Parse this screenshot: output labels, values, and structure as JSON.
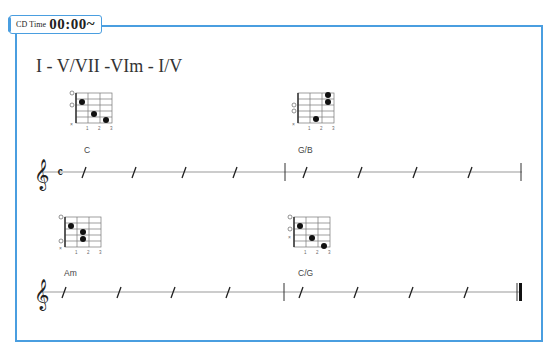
{
  "header": {
    "badge_label": "CD Time",
    "time": "00:00~"
  },
  "progression": {
    "title": "I - V/VII -VIm - I/V"
  },
  "colors": {
    "frame": "#4a9ee0",
    "ink": "#222222",
    "staff_line": "#999999"
  },
  "systems": [
    {
      "clef": "treble-clef",
      "time_signature": "common-time",
      "measures": [
        {
          "chord": "C",
          "beats": 4,
          "notation": "slash"
        },
        {
          "chord": "G/B",
          "beats": 4,
          "notation": "slash"
        }
      ],
      "end_barline": "single"
    },
    {
      "clef": "treble-clef",
      "measures": [
        {
          "chord": "Am",
          "beats": 4,
          "notation": "slash"
        },
        {
          "chord": "C/G",
          "beats": 4,
          "notation": "slash"
        }
      ],
      "end_barline": "final"
    }
  ],
  "chord_diagrams": [
    {
      "name": "C",
      "string_marks": [
        "O",
        "O",
        "",
        "",
        "",
        "x"
      ],
      "dots": [
        {
          "string": 2,
          "fret": 1
        },
        {
          "string": 4,
          "fret": 2
        },
        {
          "string": 5,
          "fret": 3
        }
      ],
      "fret_numbers": [
        "1",
        "2",
        "3"
      ]
    },
    {
      "name": "G/B",
      "string_marks": [
        "",
        "",
        "O",
        "O",
        "",
        "x"
      ],
      "dots": [
        {
          "string": 1,
          "fret": 3
        },
        {
          "string": 2,
          "fret": 3
        },
        {
          "string": 5,
          "fret": 2
        }
      ],
      "fret_numbers": [
        "1",
        "2",
        "3"
      ]
    },
    {
      "name": "Am",
      "string_marks": [
        "O",
        "",
        "",
        "",
        "O",
        "x"
      ],
      "dots": [
        {
          "string": 2,
          "fret": 1
        },
        {
          "string": 3,
          "fret": 2
        },
        {
          "string": 4,
          "fret": 2
        }
      ],
      "fret_numbers": [
        "1",
        "2",
        "3"
      ]
    },
    {
      "name": "C/G",
      "string_marks": [
        "O",
        "O",
        "",
        "x",
        "",
        ""
      ],
      "dots": [
        {
          "string": 2,
          "fret": 1
        },
        {
          "string": 4,
          "fret": 2
        },
        {
          "string": 6,
          "fret": 3
        }
      ],
      "fret_numbers": [
        "1",
        "2",
        "3"
      ]
    }
  ]
}
